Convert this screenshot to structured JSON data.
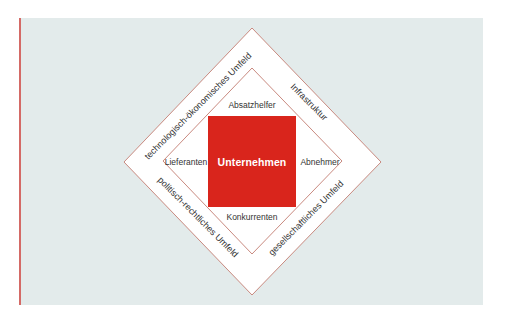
{
  "colors": {
    "panel_background": "#e3ebeb",
    "accent_line": "#d46a66",
    "core_fill": "#d9251c",
    "diamond_stroke": "#c98a80",
    "diamond_fill": "#ffffff"
  },
  "core": {
    "label": "Unternehmen"
  },
  "inner_ring": {
    "top": "Absatzhelfer",
    "left": "Lieferanten",
    "right": "Abnehmer",
    "bottom": "Konkurrenten"
  },
  "outer_ring": {
    "top_left": "technologisch-ökonomisches Umfeld",
    "top_right": "Infrastruktur",
    "bottom_left": "politisch-rechtliches Umfeld",
    "bottom_right": "gesellschaftliches Umfeld"
  }
}
